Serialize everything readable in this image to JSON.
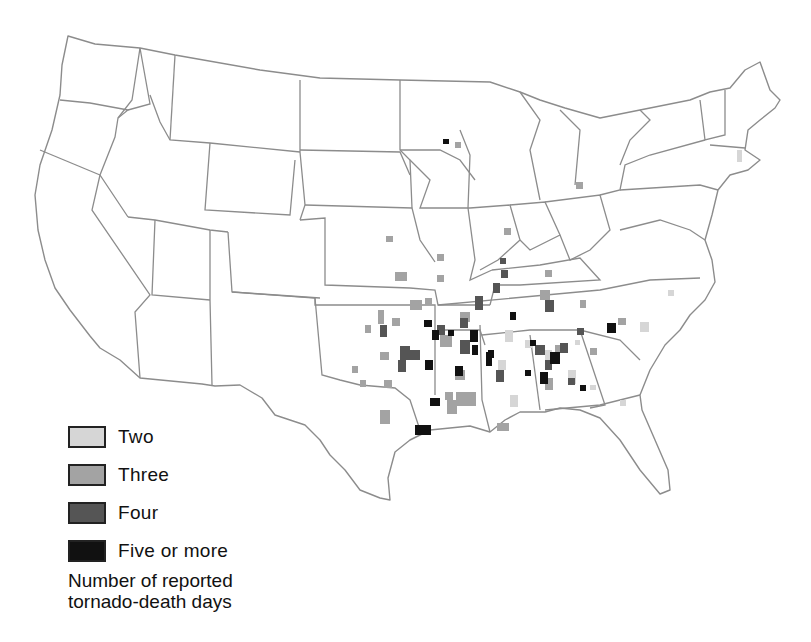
{
  "map": {
    "title": "Number of reported tornado-death days",
    "region": "Contiguous United States",
    "boundaries": "state outlines"
  },
  "legend": {
    "items": [
      {
        "label": "Two",
        "color": "#d6d6d6"
      },
      {
        "label": "Three",
        "color": "#a3a3a3"
      },
      {
        "label": "Four",
        "color": "#555555"
      },
      {
        "label": "Five or more",
        "color": "#111111"
      }
    ],
    "title_line1": "Number of reported",
    "title_line2": "tornado-death days"
  },
  "colors": {
    "background": "#ffffff",
    "state_border": "#8c8c8c",
    "text": "#111111"
  }
}
